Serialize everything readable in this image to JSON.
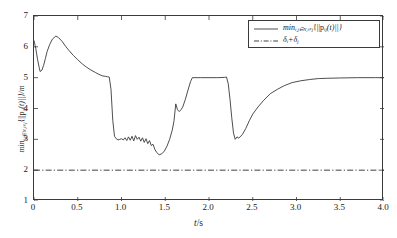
{
  "chart_data": {
    "type": "line",
    "title": "",
    "xlabel": "t/s",
    "ylabel": "min_{i,j∈N,i≠j}{||p_ij(t)||}/m",
    "xlim": [
      0,
      4.0
    ],
    "ylim": [
      1,
      7
    ],
    "xticks": [
      0,
      0.5,
      1.0,
      1.5,
      2.0,
      2.5,
      3.0,
      3.5,
      4.0
    ],
    "xtick_labels": [
      "0",
      "0.5",
      "1.0",
      "1.5",
      "2.0",
      "2.5",
      "3.0",
      "3.5",
      "4.0"
    ],
    "yticks": [
      1,
      2,
      3,
      4,
      5,
      6,
      7
    ],
    "ytick_labels": [
      "1",
      "2",
      "3",
      "4",
      "5",
      "6",
      "7"
    ],
    "grid": false,
    "legend_position": "upper right",
    "series": [
      {
        "name": "min_{i,j∈N,i≠j}{||p_ij(t)||}",
        "style": "solid",
        "color": "#3a3a3a",
        "x": [
          0.0,
          0.02,
          0.04,
          0.06,
          0.07,
          0.09,
          0.11,
          0.13,
          0.15,
          0.18,
          0.21,
          0.25,
          0.28,
          0.32,
          0.36,
          0.4,
          0.45,
          0.5,
          0.55,
          0.6,
          0.65,
          0.7,
          0.74,
          0.78,
          0.8,
          0.82,
          0.84,
          0.86,
          0.88,
          0.9,
          0.92,
          0.94,
          0.96,
          0.98,
          1.0,
          1.02,
          1.04,
          1.06,
          1.08,
          1.1,
          1.12,
          1.14,
          1.16,
          1.18,
          1.2,
          1.22,
          1.24,
          1.26,
          1.28,
          1.3,
          1.32,
          1.34,
          1.36,
          1.38,
          1.4,
          1.43,
          1.46,
          1.49,
          1.52,
          1.55,
          1.58,
          1.6,
          1.62,
          1.64,
          1.66,
          1.68,
          1.7,
          1.73,
          1.76,
          1.79,
          1.81,
          1.9,
          2.0,
          2.1,
          2.18,
          2.2,
          2.22,
          2.24,
          2.26,
          2.28,
          2.3,
          2.32,
          2.34,
          2.38,
          2.42,
          2.46,
          2.5,
          2.56,
          2.62,
          2.7,
          2.78,
          2.86,
          2.95,
          3.05,
          3.15,
          3.25,
          3.35,
          3.5,
          3.7,
          3.9,
          4.0
        ],
        "y": [
          6.2,
          5.95,
          5.6,
          5.32,
          5.2,
          5.24,
          5.4,
          5.62,
          5.85,
          6.08,
          6.25,
          6.35,
          6.3,
          6.18,
          6.02,
          5.88,
          5.72,
          5.58,
          5.45,
          5.34,
          5.25,
          5.17,
          5.11,
          5.06,
          5.05,
          5.04,
          5.03,
          5.02,
          4.62,
          3.62,
          3.1,
          3.02,
          2.98,
          3.0,
          3.02,
          2.98,
          3.05,
          2.96,
          3.08,
          2.97,
          3.1,
          2.95,
          3.12,
          3.0,
          3.07,
          2.94,
          3.05,
          2.9,
          3.02,
          2.86,
          2.96,
          2.8,
          2.84,
          2.68,
          2.58,
          2.5,
          2.53,
          2.62,
          2.78,
          3.0,
          3.3,
          3.6,
          4.15,
          3.96,
          3.9,
          3.96,
          4.05,
          4.3,
          4.6,
          4.88,
          5.0,
          5.0,
          5.0,
          5.0,
          5.01,
          5.02,
          4.8,
          4.3,
          3.7,
          3.2,
          3.0,
          3.08,
          3.04,
          3.15,
          3.35,
          3.6,
          3.82,
          4.05,
          4.25,
          4.48,
          4.62,
          4.74,
          4.84,
          4.9,
          4.94,
          4.97,
          4.98,
          4.99,
          5.0,
          5.0,
          5.0
        ]
      },
      {
        "name": "δ_i+δ_j",
        "style": "dashdot",
        "color": "#2a2a2a",
        "constant_value": 2,
        "x": [
          0,
          4.0
        ],
        "y": [
          2,
          2
        ]
      }
    ]
  },
  "axes": {
    "x_label_text": "t/s",
    "y_label_prefix": "min",
    "y_label_sub": "i,j∈N,i≠j",
    "y_label_body": "{||p",
    "y_label_body_sub": "ij",
    "y_label_body_end": "(t)||}/m"
  },
  "legend": {
    "entries": [
      {
        "sample": "solid-line-sample",
        "label_prefix": "min",
        "label_sub": "i,j∈N,i≠j",
        "label_body": "{||p",
        "label_body_sub": "ij",
        "label_body_end": "(t)||}"
      },
      {
        "sample": "dashdot-line-sample",
        "label_delta_i": "δ",
        "label_sub_i": "i",
        "label_plus": "+δ",
        "label_sub_j": "j"
      }
    ]
  }
}
